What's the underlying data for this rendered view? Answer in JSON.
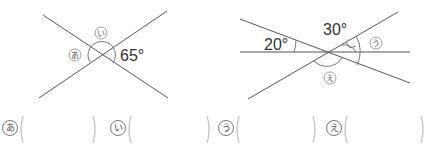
{
  "figures": [
    {
      "id": "left",
      "angle_labels": [
        {
          "mark": "あ",
          "role": "unknown"
        },
        {
          "mark": "い",
          "role": "unknown"
        },
        {
          "text": "65°",
          "role": "given",
          "value": 65
        }
      ]
    },
    {
      "id": "right",
      "angle_labels": [
        {
          "text": "20°",
          "role": "given",
          "value": 20
        },
        {
          "text": "30°",
          "role": "given",
          "value": 30,
          "note": "right-angle marker shown"
        },
        {
          "mark": "う",
          "role": "unknown"
        },
        {
          "mark": "え",
          "role": "unknown"
        }
      ]
    }
  ],
  "answers": [
    {
      "mark": "あ",
      "value": ""
    },
    {
      "mark": "い",
      "value": ""
    },
    {
      "mark": "う",
      "value": ""
    },
    {
      "mark": "え",
      "value": ""
    }
  ],
  "paren_open": "(",
  "paren_close": ")",
  "colors": {
    "line": "#555555",
    "arc": "#777777",
    "text": "#333333"
  }
}
